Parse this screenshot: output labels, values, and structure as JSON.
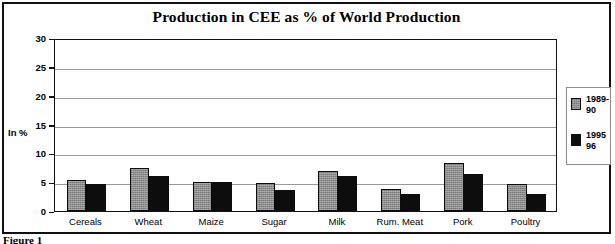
{
  "figure": {
    "caption": "Figure 1"
  },
  "chart_data": {
    "type": "bar",
    "title": "Production in CEE as % of World Production",
    "xlabel": "",
    "ylabel": "In %",
    "ylim": [
      0,
      30
    ],
    "yticks": [
      0,
      5,
      10,
      15,
      20,
      25,
      30
    ],
    "ytick_labels": [
      "0",
      "5",
      "10",
      "15",
      "20",
      "25",
      "30"
    ],
    "grid": true,
    "legend_position": "right",
    "categories": [
      "Cereals",
      "Wheat",
      "Maize",
      "Sugar",
      "Milk",
      "Rum. Meat",
      "Pork",
      "Poultry"
    ],
    "series": [
      {
        "name": "1989-90",
        "legend_line1": "1989-",
        "legend_line2": "90",
        "color": "#8c8c8c",
        "values": [
          5.3,
          7.5,
          5.1,
          4.9,
          7.0,
          3.9,
          8.4,
          4.7
        ]
      },
      {
        "name": "1995-96",
        "legend_line1": "1995",
        "legend_line2": "96",
        "color": "#0d0d0d",
        "values": [
          4.7,
          6.0,
          5.0,
          3.6,
          6.1,
          2.9,
          6.4,
          2.9
        ]
      }
    ]
  }
}
